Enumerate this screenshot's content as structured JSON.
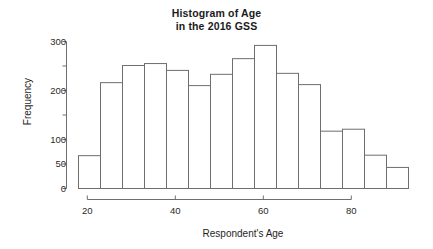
{
  "chart_data": {
    "type": "bar",
    "title": "Histogram of Age\nin the 2016 GSS",
    "title_line1": "Histogram of Age",
    "title_line2": "in the 2016 GSS",
    "xlabel": "Respondent's Age",
    "ylabel": "Frequency",
    "xlim": [
      18,
      93
    ],
    "ylim": [
      0,
      300
    ],
    "bin_width": 5,
    "grid": false,
    "legend": null,
    "x_ticks": [
      20,
      40,
      60,
      80
    ],
    "x_tick_labels": [
      "20",
      "40",
      "60",
      "80"
    ],
    "y_ticks": [
      0,
      50,
      100,
      150,
      200,
      250,
      300
    ],
    "y_tick_labels": [
      "0",
      "50",
      "100",
      "",
      "200",
      "",
      "300"
    ],
    "y_labeled_ticks": [
      0,
      50,
      100,
      200,
      300
    ],
    "bin_edges": [
      18,
      23,
      28,
      33,
      38,
      43,
      48,
      53,
      58,
      63,
      68,
      73,
      78,
      83,
      88,
      93
    ],
    "categories": [
      "18-23",
      "23-28",
      "28-33",
      "33-38",
      "38-43",
      "43-48",
      "48-53",
      "53-58",
      "58-63",
      "63-68",
      "68-73",
      "73-78",
      "78-83",
      "83-88",
      "88-93"
    ],
    "values": [
      67,
      216,
      251,
      255,
      241,
      210,
      233,
      265,
      292,
      235,
      212,
      117,
      121,
      68,
      43
    ],
    "bar_fill": "#ffffff",
    "bar_stroke": "#6e6e6e",
    "axis_color": "#6e6e6e",
    "text_color": "#1f1f1f"
  }
}
